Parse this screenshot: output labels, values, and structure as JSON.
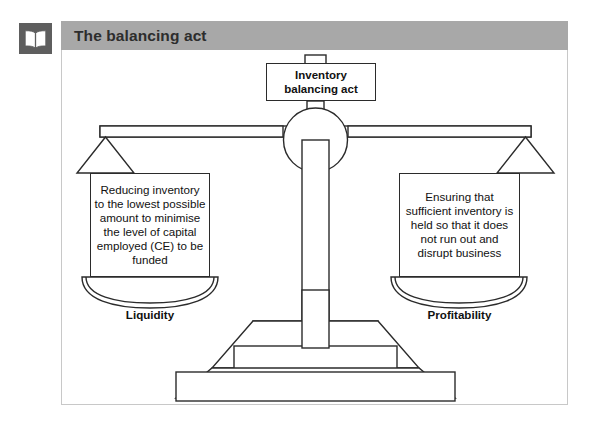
{
  "header": {
    "icon": "open-book-icon",
    "title": "The balancing act",
    "bar_color": "#a8a8a8",
    "icon_color": "#5e5e5e",
    "title_text_color": "#2d2d2d"
  },
  "diagram": {
    "type": "balance-scale",
    "stroke_color": "#2b2b2b",
    "fill_color": "#ffffff",
    "top_label": "Inventory\nbalancing act",
    "top_label_line1": "Inventory",
    "top_label_line2": "balancing act",
    "left": {
      "text": "Reducing inventory to the lowest possible amount to minimise the level of capital employed (CE) to be funded",
      "label": "Liquidity"
    },
    "right": {
      "text": "Ensuring that sufficient inventory is held so that it does not run out and disrupt business",
      "label": "Profitability"
    }
  }
}
